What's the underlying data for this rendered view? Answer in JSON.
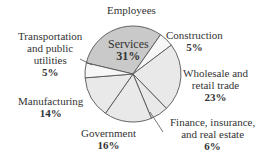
{
  "chart_data": {
    "type": "pie",
    "title": "Employees",
    "categories": [
      "Services",
      "Construction",
      "Wholesale and retail trade",
      "Finance, insurance, and real estate",
      "Government",
      "Manufacturing",
      "Transportation and public utilities"
    ],
    "values": [
      31,
      5,
      23,
      6,
      16,
      14,
      5
    ],
    "labels": {
      "services": {
        "name": "Services",
        "pct": "31%"
      },
      "construction": {
        "name": "Construction",
        "pct": "5%"
      },
      "wholesale": {
        "line1": "Wholesale and",
        "line2": "retail trade",
        "pct": "23%"
      },
      "finance": {
        "line1": "Finance, insurance,",
        "line2": "and real estate",
        "pct": "6%"
      },
      "government": {
        "name": "Government",
        "pct": "16%"
      },
      "manufacturing": {
        "name": "Manufacturing",
        "pct": "14%"
      },
      "transportation": {
        "line1": "Transportation",
        "line2": "and public",
        "line3": "utilities",
        "pct": "5%"
      }
    },
    "colors": {
      "services": "#c9c9c9",
      "default": "#e9e9e9",
      "light": "#f7f7f7",
      "stroke": "#555555"
    }
  }
}
